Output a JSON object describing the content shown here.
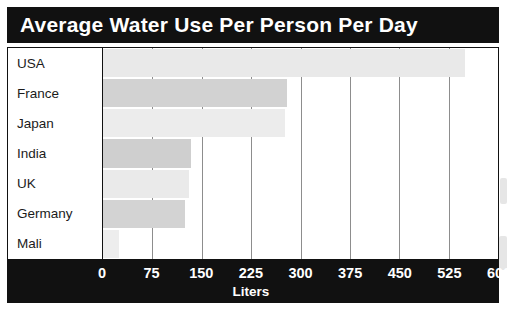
{
  "chart_data": {
    "type": "bar",
    "orientation": "horizontal",
    "title": "Average Water Use Per Person Per Day",
    "xlabel": "Liters",
    "ylabel": "",
    "categories": [
      "USA",
      "France",
      "Japan",
      "India",
      "UK",
      "Germany",
      "Mali"
    ],
    "values": [
      550,
      280,
      277,
      134,
      130,
      124,
      24
    ],
    "series": [
      {
        "name": "Average water use per person per day (liters)",
        "values": [
          550,
          280,
          277,
          134,
          130,
          124,
          24
        ]
      }
    ],
    "xlim": [
      0,
      600
    ],
    "xticks": [
      0,
      75,
      150,
      225,
      300,
      375,
      450,
      525,
      600
    ],
    "xticklabels": [
      "0",
      "75",
      "150",
      "225",
      "300",
      "375",
      "450",
      "525",
      "600"
    ],
    "grid": "vertical",
    "legend": "none",
    "bar_colors": [
      "#e9e9e9",
      "#d2d2d2",
      "#ececec",
      "#cfcfcf",
      "#eaeaea",
      "#d3d3d3",
      "#ededed"
    ]
  },
  "style": {
    "title_bg": "#111111",
    "title_fg": "#ffffff",
    "axis_bg": "#111111",
    "axis_fg": "#ffffff",
    "frame_color": "#111111",
    "gridline_color": "#8d8d8d",
    "plot_bg": "#ffffff"
  }
}
